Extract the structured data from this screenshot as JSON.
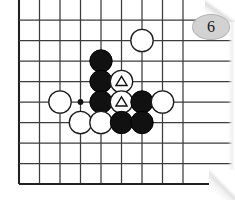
{
  "figure": {
    "kind": "go-board-diagram",
    "label": "Go game position diagram, figure 6",
    "badge": {
      "number": "6",
      "fill_color": "#d2d2d2",
      "text_color": "#1a1a1a"
    },
    "board": {
      "line_color": "#3c3c3c",
      "border_color": "#222222",
      "background_color": "#ffffff",
      "cell_size": 20.5,
      "origin_x": 19,
      "origin_y": 20,
      "cols": 9,
      "rows": 9,
      "left_edge_is_board_border": true,
      "bottom_edge_is_board_border": true,
      "top_is_cut_off": true,
      "right_is_cut_off": true,
      "star_points": [
        {
          "col": 3,
          "row": 4
        }
      ]
    },
    "stones": [
      {
        "col": 6,
        "row": 1,
        "color": "white",
        "mark": "none",
        "label": ""
      },
      {
        "col": 4,
        "row": 2,
        "color": "black",
        "mark": "none",
        "label": ""
      },
      {
        "col": 4,
        "row": 3,
        "color": "black",
        "mark": "none",
        "label": ""
      },
      {
        "col": 5,
        "row": 3,
        "color": "white",
        "mark": "triangle",
        "label": ""
      },
      {
        "col": 2,
        "row": 4,
        "color": "white",
        "mark": "none",
        "label": ""
      },
      {
        "col": 4,
        "row": 4,
        "color": "black",
        "mark": "none",
        "label": ""
      },
      {
        "col": 5,
        "row": 4,
        "color": "white",
        "mark": "triangle",
        "label": ""
      },
      {
        "col": 6,
        "row": 4,
        "color": "black",
        "mark": "none",
        "label": ""
      },
      {
        "col": 7,
        "row": 4,
        "color": "white",
        "mark": "none",
        "label": ""
      },
      {
        "col": 3,
        "row": 5,
        "color": "white",
        "mark": "none",
        "label": ""
      },
      {
        "col": 4,
        "row": 5,
        "color": "white",
        "mark": "none",
        "label": ""
      },
      {
        "col": 5,
        "row": 5,
        "color": "black",
        "mark": "none",
        "label": ""
      },
      {
        "col": 6,
        "row": 5,
        "color": "black",
        "mark": "none",
        "label": ""
      }
    ],
    "stone_style": {
      "radius": 11.2,
      "black_fill": "#111111",
      "black_stroke": "#000000",
      "white_fill": "#ffffff",
      "white_stroke": "#1a1a1a",
      "triangle_stroke": "#111111"
    }
  }
}
